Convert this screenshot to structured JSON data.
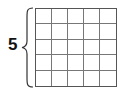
{
  "diagram": {
    "label": "5",
    "rows": 5,
    "columns": 5
  }
}
